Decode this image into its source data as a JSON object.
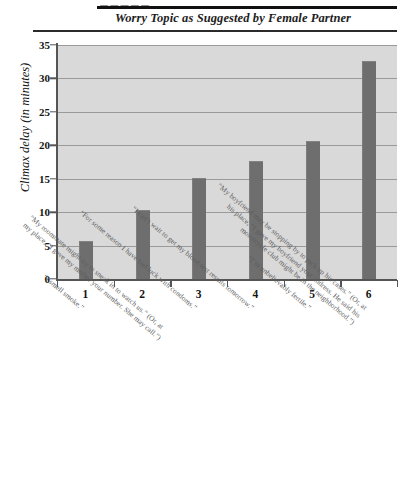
{
  "figure": {
    "cropped_header_text": "— — — — —",
    "title": "Worry Topic as Suggested by Female Partner"
  },
  "chart_data": {
    "type": "bar",
    "title": "Worry Topic as Suggested by Female Partner",
    "xlabel": "",
    "ylabel": "Climax delay (in minutes)",
    "ylim": [
      0,
      35
    ],
    "yticks": [
      0,
      5,
      10,
      15,
      20,
      25,
      30,
      35
    ],
    "ytick_labels": [
      "0",
      "5",
      "10",
      "15",
      "20",
      "25",
      "30",
      "35"
    ],
    "grid": true,
    "legend": "none",
    "categories": [
      "1",
      "2",
      "3",
      "4",
      "5",
      "6"
    ],
    "values": [
      5.6,
      10.2,
      15.0,
      17.5,
      20.5,
      32.5
    ],
    "bar_color": "#6e6e6e",
    "plot_background": "#d9d9d9",
    "category_captions": [
      {
        "n": "1",
        "line1": "“I smell smoke.”",
        "line2": ""
      },
      {
        "n": "2",
        "line1": "“My roommate might try to sneak in to watch us.” (Or, at",
        "line2": "my place, “I gave my mother your number. She may call.”)"
      },
      {
        "n": "3",
        "line1": "“For some reason I have bad luck with condoms.”",
        "line2": ""
      },
      {
        "n": "4",
        "line1": "“I can’t wait to get my blood test results tomorrow.”",
        "line2": ""
      },
      {
        "n": "5",
        "line1": "“I’m unbelievably fertile.”",
        "line2": ""
      },
      {
        "n": "6",
        "line1": "“My boyfriend may be stopping by to pick up his cases.” (Or, at",
        "line2": "his place, “I gave my boyfriend your address. He said his",
        "line3": "motorcycle club might be in the neighborhood.”)"
      }
    ]
  }
}
